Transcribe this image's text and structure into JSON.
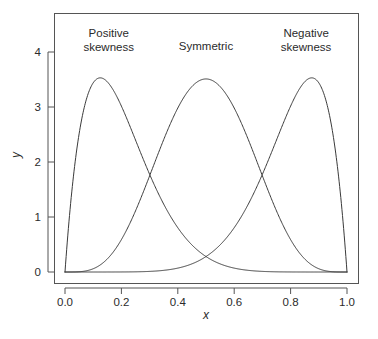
{
  "chart_data": {
    "type": "line",
    "title": "",
    "xlabel": "x",
    "ylabel": "y",
    "xlim": [
      0.0,
      1.0
    ],
    "ylim": [
      0.0,
      4.4
    ],
    "grid": false,
    "legend_position": "none",
    "xticks": [
      "0.0",
      "0.2",
      "0.4",
      "0.6",
      "0.8",
      "1.0"
    ],
    "xtick_values": [
      0.0,
      0.2,
      0.4,
      0.6,
      0.8,
      1.0
    ],
    "yticks": [
      "0",
      "1",
      "2",
      "3",
      "4"
    ],
    "ytick_values": [
      0,
      1,
      2,
      3,
      4
    ],
    "series": [
      {
        "name": "Positive skewness",
        "distribution": "beta",
        "alpha": 2,
        "beta": 8,
        "peak_x": 0.125,
        "peak_y": 3.53
      },
      {
        "name": "Symmetric",
        "distribution": "beta",
        "alpha": 5,
        "beta": 5,
        "peak_x": 0.5,
        "peak_y": 3.51
      },
      {
        "name": "Negative skewness",
        "distribution": "beta",
        "alpha": 8,
        "beta": 2,
        "peak_x": 0.875,
        "peak_y": 3.53
      }
    ],
    "annotations": [
      {
        "id": "positive",
        "lines": [
          "Positive",
          "skewness"
        ],
        "x": 0.155,
        "y": 4.28
      },
      {
        "id": "symmetric",
        "lines": [
          "Symmetric"
        ],
        "x": 0.5,
        "y": 4.04
      },
      {
        "id": "negative",
        "lines": [
          "Negative",
          "skewness"
        ],
        "x": 0.855,
        "y": 4.28
      }
    ],
    "crossings": [
      {
        "between": [
          "Positive skewness",
          "Symmetric"
        ],
        "x": 0.344,
        "y": 1.31
      },
      {
        "between": [
          "Symmetric",
          "Negative skewness"
        ],
        "x": 0.656,
        "y": 1.31
      },
      {
        "between": [
          "Positive skewness",
          "Negative skewness"
        ],
        "x": 0.5,
        "y": 0.25
      }
    ],
    "colors": {
      "curve": "#3a3a3a",
      "frame": "#555555",
      "text": "#2b2b2b",
      "background": "#ffffff"
    }
  }
}
